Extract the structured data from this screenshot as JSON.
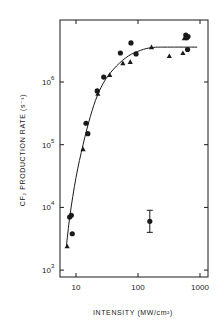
{
  "chart_data": {
    "type": "scatter",
    "title": "",
    "xlabel": "INTENSITY (MW/cm²)",
    "ylabel": "CF₂ PRODUCTION RATE (s⁻¹)",
    "xscale": "log",
    "yscale": "log",
    "xlim": [
      5.5,
      1100
    ],
    "ylim": [
      800,
      9000000
    ],
    "x_ticks": [
      10,
      100,
      1000
    ],
    "x_tick_labels": [
      "10",
      "100",
      "1000"
    ],
    "y_ticks": [
      1000,
      10000,
      100000,
      1000000
    ],
    "y_tick_labels": [
      {
        "base": "10",
        "exp": "3"
      },
      {
        "base": "10",
        "exp": "4"
      },
      {
        "base": "10",
        "exp": "5"
      },
      {
        "base": "10",
        "exp": "6"
      }
    ],
    "grid": false,
    "legend": null,
    "series": [
      {
        "name": "circles",
        "marker": "circle",
        "points": [
          {
            "x": 7.9,
            "y": 7000
          },
          {
            "x": 8.4,
            "y": 7500
          },
          {
            "x": 8.7,
            "y": 3800
          },
          {
            "x": 14.5,
            "y": 220000
          },
          {
            "x": 15.5,
            "y": 150000
          },
          {
            "x": 22,
            "y": 720000
          },
          {
            "x": 28,
            "y": 1200000
          },
          {
            "x": 52,
            "y": 2900000
          },
          {
            "x": 77,
            "y": 4200000
          },
          {
            "x": 93,
            "y": 2800000
          },
          {
            "x": 590,
            "y": 5600000
          },
          {
            "x": 610,
            "y": 5100000
          },
          {
            "x": 640,
            "y": 5300000
          },
          {
            "x": 630,
            "y": 3300000
          }
        ]
      },
      {
        "name": "triangles",
        "marker": "triangle",
        "points": [
          {
            "x": 7.2,
            "y": 2400
          },
          {
            "x": 13,
            "y": 85000
          },
          {
            "x": 22.5,
            "y": 650000
          },
          {
            "x": 35,
            "y": 1300000
          },
          {
            "x": 57,
            "y": 2000000
          },
          {
            "x": 75,
            "y": 2100000
          },
          {
            "x": 165,
            "y": 3600000
          },
          {
            "x": 320,
            "y": 2600000
          },
          {
            "x": 530,
            "y": 2900000
          },
          {
            "x": 560,
            "y": 5000000
          }
        ]
      },
      {
        "name": "representative error",
        "marker": "circle",
        "points": [
          {
            "x": 155,
            "y": 6000,
            "y_err_low": 4000,
            "y_err_high": 9000
          }
        ]
      }
    ],
    "fit_curve": {
      "name": "fit",
      "points": [
        {
          "x": 7.0,
          "y": 2400
        },
        {
          "x": 8.0,
          "y": 7500
        },
        {
          "x": 10,
          "y": 30000
        },
        {
          "x": 13,
          "y": 100000
        },
        {
          "x": 17,
          "y": 280000
        },
        {
          "x": 22,
          "y": 600000
        },
        {
          "x": 30,
          "y": 1100000
        },
        {
          "x": 45,
          "y": 1800000
        },
        {
          "x": 70,
          "y": 2600000
        },
        {
          "x": 110,
          "y": 3200000
        },
        {
          "x": 170,
          "y": 3550000
        },
        {
          "x": 300,
          "y": 3600000
        },
        {
          "x": 900,
          "y": 3600000
        }
      ]
    },
    "plot_box_px": {
      "left": 60,
      "top": 20,
      "right": 208,
      "bottom": 277
    },
    "axis_map_px": {
      "x_decade_px": 62,
      "x_ref": {
        "value": 10,
        "px": 76
      },
      "y_decade_px": 62.7,
      "y_ref": {
        "value": 1000000,
        "px": 82
      }
    },
    "colors": {
      "ink": "#1a1a1a",
      "background": "#ffffff"
    }
  }
}
